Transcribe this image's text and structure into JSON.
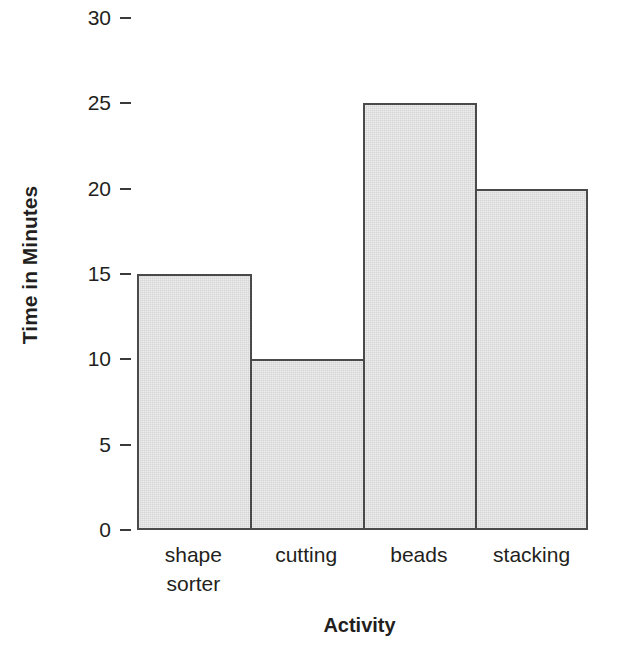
{
  "chart_data": {
    "type": "bar",
    "title": "",
    "subtitle": "",
    "xlabel": "Activity",
    "ylabel": "Time in Minutes",
    "categories": [
      "shape sorter",
      "cutting",
      "beads",
      "stacking"
    ],
    "category_lines": [
      [
        "shape",
        "sorter"
      ],
      [
        "cutting"
      ],
      [
        "beads"
      ],
      [
        "stacking"
      ]
    ],
    "values": [
      15,
      10,
      25,
      20
    ],
    "series": [
      {
        "name": "Time in Minutes",
        "values": [
          15,
          10,
          25,
          20
        ]
      }
    ],
    "ylim": [
      0,
      30
    ],
    "xlim": [
      0,
      4
    ],
    "y_ticks": [
      0,
      5,
      10,
      15,
      20,
      25,
      30
    ],
    "y_tick_labels": [
      "0",
      "5",
      "10",
      "15",
      "20",
      "25",
      "30"
    ],
    "grid": false,
    "legend": "none",
    "annotations": [],
    "bar_gap": 0,
    "colors": {
      "bar_fill": "#d5d5d5",
      "bar_edge": "#4a4a4a",
      "text": "#231f20",
      "tick_mark": "#3a3a3a",
      "background": "#ffffff"
    }
  },
  "axes": {
    "y_title": "Time in Minutes",
    "x_title": "Activity"
  }
}
